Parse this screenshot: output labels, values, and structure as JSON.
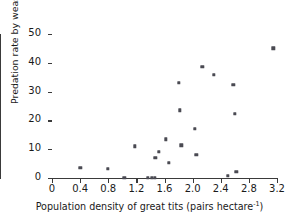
{
  "chart_data": {
    "type": "scatter",
    "title": "",
    "xlabel": "Population density of great tits (pairs hectare⁻¹)",
    "xlabel_text": "Population density of great tits (pairs hectare",
    "xlabel_sup": "-1",
    "xlabel_tail": ")",
    "ylabel": "Predation rate by weasels on great tits (%)",
    "xlim": [
      0,
      3.2
    ],
    "ylim": [
      0,
      50
    ],
    "grid": false,
    "legend": false,
    "xticks": [
      0,
      0.4,
      0.8,
      1.2,
      1.6,
      2.0,
      2.4,
      2.8,
      3.2
    ],
    "xticklabels": [
      "0",
      "0.4",
      "0.8",
      "1.2",
      "1.6",
      "2.0",
      "2.4",
      "2.8",
      "3.2"
    ],
    "yticks": [
      0,
      10,
      20,
      30,
      40,
      50
    ],
    "yticklabels": [
      "0",
      "10",
      "20",
      "30",
      "40",
      "50"
    ],
    "marker": "square",
    "marker_color": "#4a4a52",
    "axis_color": "#3a3a3a",
    "points": [
      {
        "x": 0.4,
        "y": 3.5
      },
      {
        "x": 0.79,
        "y": 3.1
      },
      {
        "x": 1.03,
        "y": 0.0
      },
      {
        "x": 1.18,
        "y": 11.0
      },
      {
        "x": 1.36,
        "y": 0.0
      },
      {
        "x": 1.42,
        "y": 0.0
      },
      {
        "x": 1.46,
        "y": 0.0
      },
      {
        "x": 1.47,
        "y": 7.0
      },
      {
        "x": 1.52,
        "y": 9.0
      },
      {
        "x": 1.62,
        "y": 13.5
      },
      {
        "x": 1.66,
        "y": 5.2
      },
      {
        "x": 1.8,
        "y": 33.1
      },
      {
        "x": 1.82,
        "y": 23.5
      },
      {
        "x": 1.84,
        "y": 11.4
      },
      {
        "x": 2.03,
        "y": 17.0
      },
      {
        "x": 2.05,
        "y": 8.0
      },
      {
        "x": 2.14,
        "y": 38.6
      },
      {
        "x": 2.3,
        "y": 35.9
      },
      {
        "x": 2.5,
        "y": 0.7
      },
      {
        "x": 2.58,
        "y": 32.4
      },
      {
        "x": 2.6,
        "y": 22.2
      },
      {
        "x": 2.62,
        "y": 2.2
      },
      {
        "x": 3.15,
        "y": 45.1
      }
    ]
  }
}
